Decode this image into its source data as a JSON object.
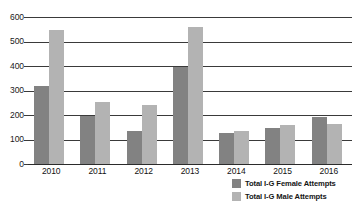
{
  "chart_data": {
    "type": "bar",
    "title": "",
    "subtitle": "",
    "xlabel": "",
    "ylabel": "",
    "categories": [
      "2010",
      "2011",
      "2012",
      "2013",
      "2014",
      "2015",
      "2016"
    ],
    "series": [
      {
        "name": "Total I-G Female Attempts",
        "color": "#828282",
        "values": [
          320,
          195,
          135,
          395,
          128,
          148,
          190
        ]
      },
      {
        "name": "Total I-G Male Attempts",
        "color": "#b3b3b3",
        "values": [
          545,
          255,
          240,
          560,
          135,
          160,
          165
        ]
      }
    ],
    "ylim": [
      0,
      600
    ],
    "y_ticks": [
      "0",
      "100",
      "200",
      "300",
      "400",
      "500",
      "600"
    ],
    "y_tick_values": [
      0,
      100,
      200,
      300,
      400,
      500,
      600
    ],
    "grid": true,
    "legend_position": "bottom-right"
  },
  "legend": {
    "items": [
      {
        "label": "Total I-G Female Attempts",
        "swatch": "female"
      },
      {
        "label": "Total I-G Male Attempts",
        "swatch": "male"
      }
    ]
  }
}
